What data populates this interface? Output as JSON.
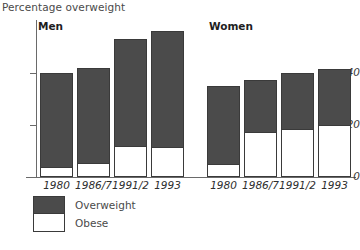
{
  "chart_data": {
    "type": "bar",
    "title": "Percentage overweight",
    "subtitle": "",
    "xlabel": "",
    "ylabel": "",
    "ylim": [
      0,
      60
    ],
    "grid": false,
    "stacked": true,
    "legend_position": "bottom-left",
    "yticks": [
      {
        "value": 0,
        "label": "0"
      },
      {
        "value": 20,
        "label": "20"
      },
      {
        "value": 40,
        "label": "40"
      }
    ],
    "legend": [
      {
        "name": "Overweight",
        "color": "#4b4b4b"
      },
      {
        "name": "Obese",
        "color": "#ffffff"
      }
    ],
    "groups": [
      {
        "name": "Men",
        "categories": [
          "1980",
          "1986/7",
          "1991/2",
          "1993"
        ],
        "series": [
          {
            "name": "Overweight",
            "values": [
              40,
              42,
              53,
              56
            ]
          },
          {
            "name": "Obese",
            "values": [
              3.5,
              5,
              11.5,
              11
            ]
          }
        ]
      },
      {
        "name": "Women",
        "categories": [
          "1980",
          "1986/7",
          "1991/2",
          "1993"
        ],
        "series": [
          {
            "name": "Overweight",
            "values": [
              35,
              37.5,
              40,
              41.5
            ]
          },
          {
            "name": "Obese",
            "values": [
              4.5,
              17,
              18,
              19.5
            ]
          }
        ]
      }
    ]
  },
  "colors": {
    "overweight": "#4b4b4b",
    "obese": "#ffffff",
    "axis": "#6a6a6a",
    "text": "#3a3a3a"
  }
}
